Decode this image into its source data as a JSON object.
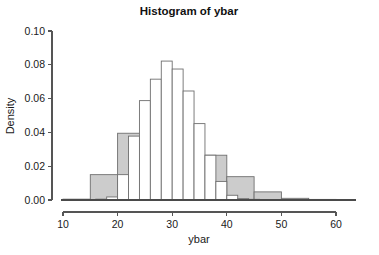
{
  "chart_data": {
    "type": "bar",
    "title": "Histogram of ybar",
    "xlabel": "ybar",
    "ylabel": "Density",
    "xlim": [
      10,
      60
    ],
    "ylim": [
      0.0,
      0.1
    ],
    "grid": false,
    "legend": null,
    "xticks": [
      "10",
      "20",
      "30",
      "40",
      "50",
      "60"
    ],
    "xtick_values": [
      10,
      20,
      30,
      40,
      50,
      60
    ],
    "yticks": [
      "0.00",
      "0.02",
      "0.04",
      "0.06",
      "0.08",
      "0.10"
    ],
    "ytick_values": [
      0.0,
      0.02,
      0.04,
      0.06,
      0.08,
      0.1
    ],
    "series": [
      {
        "name": "gray-histogram",
        "fill": "#cccccc",
        "edge": "#6f6f6f",
        "bin_width": 5,
        "bins": [
          {
            "x0": 10,
            "x1": 15,
            "value": 0.0005
          },
          {
            "x0": 15,
            "x1": 20,
            "value": 0.015
          },
          {
            "x0": 20,
            "x1": 25,
            "value": 0.0395
          },
          {
            "x0": 25,
            "x1": 30,
            "value": 0.0
          },
          {
            "x0": 30,
            "x1": 35,
            "value": 0.0
          },
          {
            "x0": 35,
            "x1": 40,
            "value": 0.0265
          },
          {
            "x0": 40,
            "x1": 45,
            "value": 0.0138
          },
          {
            "x0": 45,
            "x1": 50,
            "value": 0.0048
          },
          {
            "x0": 50,
            "x1": 55,
            "value": 0.001
          },
          {
            "x0": 55,
            "x1": 60,
            "value": 0.0003
          }
        ]
      },
      {
        "name": "white-histogram",
        "fill": "#ffffff",
        "edge": "#6f6f6f",
        "bin_width": 2,
        "bins": [
          {
            "x0": 16,
            "x1": 18,
            "value": 0.0005
          },
          {
            "x0": 18,
            "x1": 20,
            "value": 0.0018
          },
          {
            "x0": 20,
            "x1": 22,
            "value": 0.015
          },
          {
            "x0": 22,
            "x1": 24,
            "value": 0.0378
          },
          {
            "x0": 24,
            "x1": 26,
            "value": 0.0588
          },
          {
            "x0": 26,
            "x1": 28,
            "value": 0.0715
          },
          {
            "x0": 28,
            "x1": 30,
            "value": 0.0822
          },
          {
            "x0": 30,
            "x1": 32,
            "value": 0.0775
          },
          {
            "x0": 32,
            "x1": 34,
            "value": 0.0645
          },
          {
            "x0": 34,
            "x1": 36,
            "value": 0.0452
          },
          {
            "x0": 36,
            "x1": 38,
            "value": 0.0265
          },
          {
            "x0": 38,
            "x1": 40,
            "value": 0.011
          },
          {
            "x0": 40,
            "x1": 42,
            "value": 0.0028
          },
          {
            "x0": 42,
            "x1": 44,
            "value": 0.0008
          },
          {
            "x0": 44,
            "x1": 46,
            "value": 0.0004
          }
        ]
      }
    ]
  },
  "layout": {
    "plot_left": 63,
    "plot_right": 336,
    "plot_bottom": 200,
    "plot_top": 31,
    "axis_x_y": 212,
    "axis_y_x": 52
  }
}
